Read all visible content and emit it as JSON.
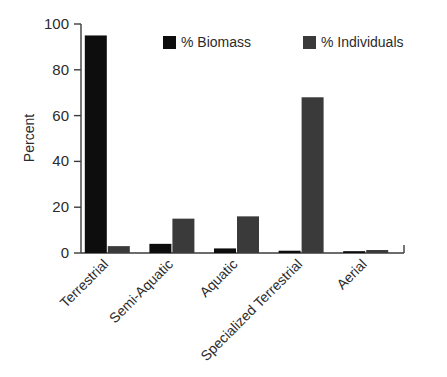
{
  "chart_data": {
    "type": "bar",
    "title": "",
    "xlabel": "",
    "ylabel": "Percent",
    "ylim": [
      0,
      100
    ],
    "yticks": [
      0,
      20,
      40,
      60,
      80,
      100
    ],
    "ytick_labels": [
      "0",
      "20",
      "40",
      "60",
      "80",
      "100"
    ],
    "grid": false,
    "legend_position": "top-center",
    "categories": [
      "Terrestrial",
      "Semi-Aquatic",
      "Aquatic",
      "Specialized Terrestrial",
      "Aerial"
    ],
    "series": [
      {
        "name": "% Biomass",
        "color": "#0d0d0d",
        "values": [
          95,
          4,
          2,
          1,
          0.8
        ]
      },
      {
        "name": "% Individuals",
        "color": "#3a3a3a",
        "values": [
          3,
          15,
          16,
          68,
          1.3
        ]
      }
    ]
  },
  "axis": {
    "y_title": "Percent"
  },
  "legend": {
    "items": [
      {
        "label": "% Biomass",
        "swatch_color": "#0d0d0d"
      },
      {
        "label": "% Individuals",
        "swatch_color": "#3a3a3a"
      }
    ]
  }
}
